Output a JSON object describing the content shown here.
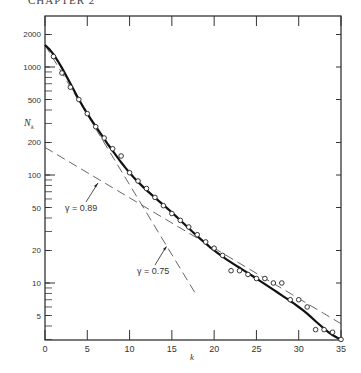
{
  "header": "CHAPTER 2",
  "chart_data": {
    "type": "scatter",
    "title": "",
    "xlabel": "k",
    "ylabel": "N_k",
    "yscale": "log",
    "xlim": [
      0,
      35
    ],
    "ylim": [
      2.5,
      2600
    ],
    "x_ticks": [
      0,
      5,
      10,
      15,
      20,
      25,
      30,
      35
    ],
    "y_ticks": [
      5,
      10,
      20,
      50,
      100,
      200,
      500,
      1000,
      2000
    ],
    "series": [
      {
        "name": "observed",
        "marker": "open-circle",
        "x": [
          1,
          2,
          3,
          4,
          5,
          6,
          7,
          8,
          9,
          10,
          11,
          12,
          13,
          14,
          15,
          16,
          17,
          18,
          19,
          20,
          21,
          22,
          23,
          24,
          25,
          26,
          27,
          28,
          29,
          30,
          31,
          32,
          33,
          34,
          35
        ],
        "y": [
          1250,
          880,
          650,
          500,
          370,
          280,
          220,
          175,
          150,
          105,
          88,
          75,
          62,
          52,
          44,
          38,
          33,
          28,
          24,
          21,
          18,
          13,
          13,
          12,
          11,
          11,
          10,
          10,
          7,
          7,
          6,
          3.7,
          3.7,
          3.5,
          3
        ]
      },
      {
        "name": "fitted curve",
        "style": "solid-thick",
        "x": [
          0,
          5,
          10,
          15,
          20,
          25,
          30,
          35
        ],
        "y": [
          1600,
          370,
          105,
          45,
          20,
          11,
          6,
          3
        ]
      },
      {
        "name": "gamma 0.75 line",
        "style": "dashed",
        "x": [
          0,
          18
        ],
        "y": [
          1600,
          7.5
        ]
      },
      {
        "name": "gamma 0.89 line",
        "style": "dashed",
        "x": [
          0,
          35
        ],
        "y": [
          180,
          4.2
        ]
      }
    ],
    "annotations": [
      {
        "text": "γ = 0.89",
        "x": 5.5,
        "y": 60
      },
      {
        "text": "γ = 0.75",
        "x": 12,
        "y": 13
      }
    ]
  },
  "labels": {
    "ylabel": "N",
    "ylabel_sub": "k",
    "xlabel": "k",
    "ann1": "γ = 0.89",
    "ann2": "γ = 0.75"
  }
}
